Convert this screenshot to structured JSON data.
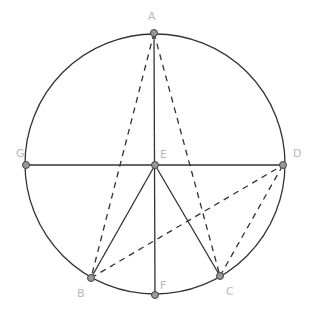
{
  "diagram": {
    "circle": {
      "cx": 155,
      "cy": 164,
      "r": 130
    },
    "points": [
      {
        "id": "A",
        "x": 154,
        "y": 33,
        "lx": 148,
        "ly": 20
      },
      {
        "id": "B",
        "x": 91,
        "y": 278,
        "lx": 77,
        "ly": 297
      },
      {
        "id": "C",
        "x": 220,
        "y": 276,
        "lx": 226,
        "ly": 295
      },
      {
        "id": "D",
        "x": 283,
        "y": 165,
        "lx": 293,
        "ly": 157
      },
      {
        "id": "E",
        "x": 155,
        "y": 165,
        "lx": 160,
        "ly": 158
      },
      {
        "id": "F",
        "x": 155,
        "y": 295,
        "lx": 160,
        "ly": 289
      },
      {
        "id": "G",
        "x": 26,
        "y": 165,
        "lx": 16,
        "ly": 157
      }
    ],
    "solid_segments": [
      [
        "G",
        "D"
      ],
      [
        "A",
        "F"
      ],
      [
        "E",
        "B"
      ],
      [
        "E",
        "C"
      ]
    ],
    "dashed_segments": [
      [
        "A",
        "B"
      ],
      [
        "A",
        "C"
      ],
      [
        "B",
        "D"
      ],
      [
        "C",
        "D"
      ]
    ],
    "colors": {
      "line": "#333333",
      "point_fill": "#999999",
      "point_stroke": "#444444",
      "label": "#b8b8b8"
    }
  }
}
